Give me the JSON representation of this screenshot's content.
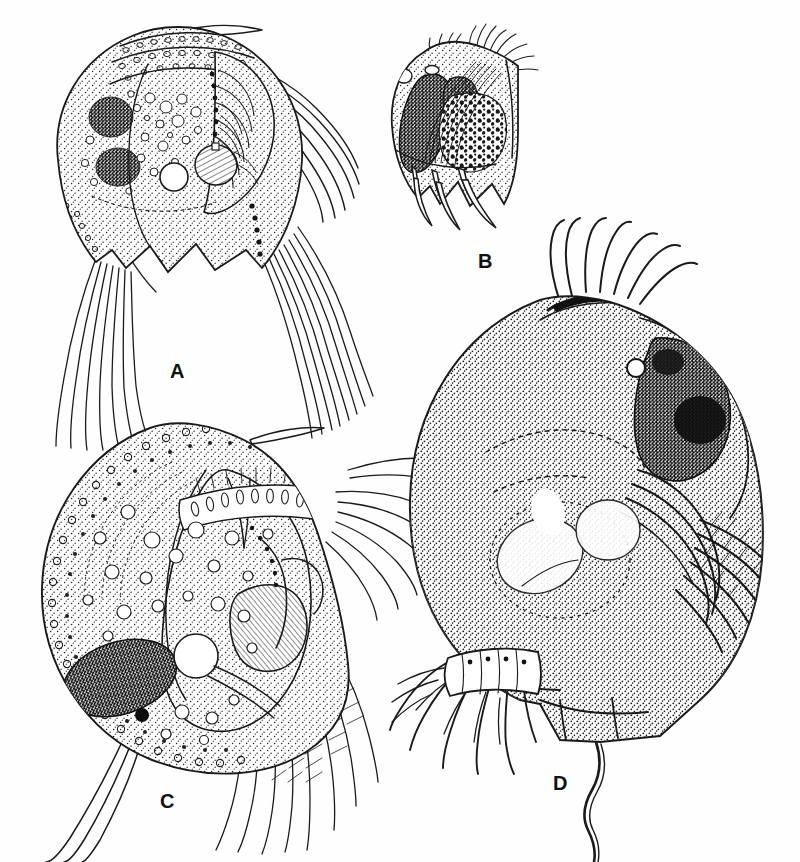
{
  "plate": {
    "type": "scientific-illustration-plate",
    "subject": "cladoceran microcrustaceans, lateral views",
    "technique": "pen-and-ink stipple drawing",
    "background_color": "#fefefe",
    "ink_color": "#1a1a1a",
    "panel_count": 4
  },
  "panels": [
    {
      "id": "A",
      "label": "A",
      "label_x": 170,
      "label_y": 378,
      "cx": 205,
      "cy": 175,
      "description": "Specimen with high rounded carapace, beaded dorsal crest, scalloped ventral margin with three rounded lobes, two dark ovoid ovaries, large clear central vacuole, long posterior setae bundles",
      "features": {
        "dark_masses": 2,
        "ventral_lobes": 3,
        "setae_bundles": 2,
        "beaded_margin": true,
        "clear_vacuole": true
      }
    },
    {
      "id": "B",
      "label": "B",
      "label_x": 478,
      "label_y": 268,
      "cx": 468,
      "cy": 140,
      "description": "Smallest specimen, oval body with dark curved crescent pigment mass at anterior left, granular speckled gut mass at centre, tuft of fine setae at top, three tapered ventral claws below",
      "features": {
        "dark_masses": 1,
        "granular_mass": true,
        "apical_tuft": true,
        "ventral_claws": 3
      }
    },
    {
      "id": "C",
      "label": "C",
      "label_x": 160,
      "label_y": 808,
      "cx": 190,
      "cy": 615,
      "description": "Large rounded specimen with fully beaded circular carapace margin, ringed dorsal texture, many clear globules, large stippled dark ovoid ovary at lower left with small dark nodule, segmented ribbed appendage at right, feathered setae",
      "features": {
        "dark_masses": 1,
        "globules": 24,
        "beaded_margin": true,
        "ribbed_appendage": true,
        "tail_setae": 3
      }
    },
    {
      "id": "D",
      "label": "D",
      "label_x": 553,
      "label_y": 790,
      "cx": 590,
      "cy": 545,
      "description": "Largest specimen, densely stippled globular carapace, dark pear-shaped compound eye with small round ocellus anterior to it, crown of long curved setae at apex, concentric ribbed labral region, plumose antennal setae at right, branched thoracic limbs below left, long sinuous post-abdominal tail",
      "features": {
        "compound_eye": true,
        "ocellus": true,
        "apical_setae": 7,
        "limb_branches": 6,
        "tail_filament": true
      }
    }
  ]
}
